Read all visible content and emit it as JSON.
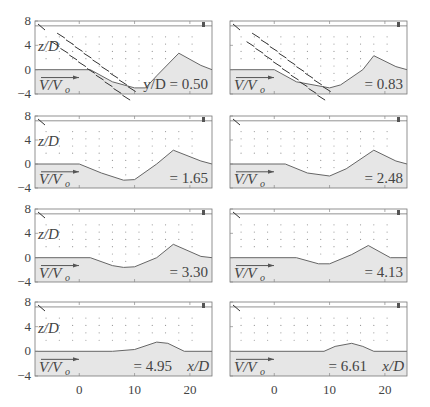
{
  "chart_data": {
    "type": "quiver",
    "title": "",
    "xlabel": "x/D",
    "ylabel": "z/D",
    "vector_label": "V/V_o",
    "xlim": [
      -8,
      24
    ],
    "ylim": [
      -4,
      8
    ],
    "xticks": [
      0,
      10,
      20
    ],
    "yticks": [
      -4,
      0,
      4,
      8
    ],
    "layout": {
      "rows": 4,
      "cols": 2
    },
    "panels": [
      {
        "label": "y/D = 0.50",
        "slice": "y/D",
        "value": 0.5,
        "bed": [
          [
            -8,
            0
          ],
          [
            2,
            0
          ],
          [
            6,
            -2
          ],
          [
            10,
            -3
          ],
          [
            12,
            -3
          ],
          [
            14,
            -1
          ],
          [
            18,
            2.7
          ],
          [
            22,
            0.7
          ],
          [
            24,
            0
          ]
        ]
      },
      {
        "label": "= 0.83",
        "slice": "y/D",
        "value": 0.83,
        "bed": [
          [
            -8,
            0
          ],
          [
            0,
            0
          ],
          [
            4,
            -2
          ],
          [
            10,
            -3
          ],
          [
            12,
            -2.5
          ],
          [
            16,
            0
          ],
          [
            18,
            2.3
          ],
          [
            22,
            0.5
          ],
          [
            24,
            0
          ]
        ]
      },
      {
        "label": "= 1.65",
        "slice": "y/D",
        "value": 1.65,
        "bed": [
          [
            -8,
            0
          ],
          [
            0,
            0
          ],
          [
            4,
            -1.5
          ],
          [
            8,
            -2.7
          ],
          [
            10,
            -2.6
          ],
          [
            14,
            0
          ],
          [
            17,
            2.3
          ],
          [
            22,
            0.5
          ],
          [
            24,
            0
          ]
        ]
      },
      {
        "label": "= 2.48",
        "slice": "y/D",
        "value": 2.48,
        "bed": [
          [
            -8,
            0
          ],
          [
            2,
            0
          ],
          [
            6,
            -1.5
          ],
          [
            10,
            -2
          ],
          [
            13,
            -0.8
          ],
          [
            18,
            2.3
          ],
          [
            22,
            0.5
          ],
          [
            24,
            0
          ]
        ]
      },
      {
        "label": "= 3.30",
        "slice": "y/D",
        "value": 3.3,
        "bed": [
          [
            -8,
            0
          ],
          [
            2,
            0
          ],
          [
            6,
            -1.3
          ],
          [
            8,
            -1.6
          ],
          [
            10,
            -1.5
          ],
          [
            14,
            0
          ],
          [
            17,
            2.2
          ],
          [
            22,
            0.2
          ],
          [
            24,
            0
          ]
        ]
      },
      {
        "label": "= 4.13",
        "slice": "y/D",
        "value": 4.13,
        "bed": [
          [
            -8,
            0
          ],
          [
            4,
            0
          ],
          [
            8,
            -1
          ],
          [
            10,
            -1
          ],
          [
            14,
            0.5
          ],
          [
            17,
            2
          ],
          [
            21,
            0
          ],
          [
            24,
            0
          ]
        ]
      },
      {
        "label": "= 4.95",
        "slice": "x/D",
        "value": 4.95,
        "bed": [
          [
            -8,
            0
          ],
          [
            6,
            0
          ],
          [
            10,
            0.3
          ],
          [
            14,
            1.5
          ],
          [
            16,
            1.3
          ],
          [
            19,
            0
          ],
          [
            24,
            0
          ]
        ]
      },
      {
        "label": "= 6.61",
        "slice": "x/D",
        "value": 6.61,
        "bed": [
          [
            -8,
            0
          ],
          [
            9,
            0
          ],
          [
            11,
            0.8
          ],
          [
            14,
            1.3
          ],
          [
            16,
            0.8
          ],
          [
            18,
            0
          ],
          [
            24,
            0
          ]
        ]
      }
    ],
    "grid": false,
    "legend": "none"
  },
  "ticks": {
    "x": [
      "0",
      "10",
      "20"
    ],
    "y": [
      "8",
      "4",
      "0",
      "−4"
    ]
  },
  "labels": {
    "ylabel": "z/D",
    "xlabel": "x/D",
    "vector": "V/V",
    "vector_sub": "o"
  }
}
